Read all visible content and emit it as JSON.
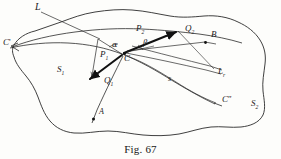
{
  "figure": {
    "caption": "Fig. 67",
    "domain_type": "geometric-optics-diagram",
    "stroke_color": "#2a2a2a",
    "thick_stroke_color": "#111111",
    "background_color": "#fdfdfb"
  },
  "regions": [
    {
      "key": "s1",
      "label": "S",
      "sub": "1",
      "x": 58,
      "y": 68,
      "desc": "left region of the interface"
    },
    {
      "key": "s2",
      "label": "S",
      "sub": "2",
      "x": 252,
      "y": 102,
      "desc": "right region of the interface"
    }
  ],
  "points": [
    {
      "key": "c-prime",
      "label": "C",
      "prime": "'",
      "x": 3,
      "y": 40
    },
    {
      "key": "c",
      "label": "C",
      "prime": "",
      "x": 124,
      "y": 55
    },
    {
      "key": "c-double",
      "label": "C",
      "prime": "″",
      "x": 222,
      "y": 98
    },
    {
      "key": "a",
      "label": "A",
      "prime": "",
      "x": 98,
      "y": 110
    },
    {
      "key": "b",
      "label": "B",
      "prime": "",
      "x": 211,
      "y": 34
    }
  ],
  "vectors": [
    {
      "key": "p1",
      "label": "P",
      "sub": "1",
      "x": 101,
      "y": 53,
      "desc": "incident vector P1 pointing down-left from C"
    },
    {
      "key": "p2",
      "label": "P",
      "sub": "2",
      "x": 137,
      "y": 27,
      "desc": "vector P2 label above C"
    },
    {
      "key": "q1",
      "label": "Q",
      "sub": "1",
      "x": 105,
      "y": 79,
      "desc": "vector Q1 label below-left of C"
    },
    {
      "key": "q2",
      "label": "Q",
      "sub": "2",
      "x": 186,
      "y": 27,
      "desc": "refracted vector Q2 pointing up-right from C"
    }
  ],
  "lines": [
    {
      "key": "l",
      "label": "L",
      "sub": "",
      "x": 35,
      "y": 4,
      "desc": "leader line to the boundary curve L"
    },
    {
      "key": "lr",
      "label": "L",
      "sub": "r",
      "x": 219,
      "y": 70,
      "desc": "line L sub r to the right"
    },
    {
      "key": "s",
      "label": "s",
      "sub": "",
      "x": 168,
      "y": 77,
      "desc": "arc s from C to C double-prime"
    }
  ],
  "angles": [
    {
      "key": "alpha",
      "glyph": "α",
      "x": 113,
      "y": 44,
      "desc": "angle alpha left of C"
    },
    {
      "key": "beta",
      "glyph": "β",
      "x": 144,
      "y": 42,
      "desc": "angle beta right of C"
    }
  ]
}
